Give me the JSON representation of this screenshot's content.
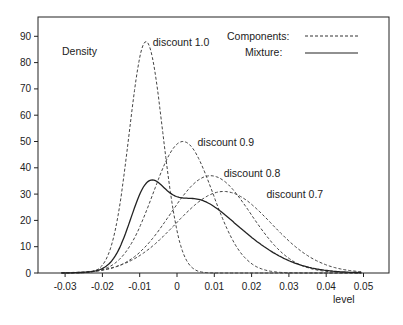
{
  "chart_data": {
    "type": "line",
    "title": "",
    "xlabel": "level",
    "ylabel": "Density",
    "xlim": [
      -0.037,
      0.057
    ],
    "ylim": [
      0,
      97
    ],
    "x_ticks": [
      "-0.03",
      "-0.02",
      "-0.01",
      "0",
      "0.01",
      "0.02",
      "0.03",
      "0.04",
      "0.05"
    ],
    "y_ticks": [
      "0",
      "10",
      "20",
      "30",
      "40",
      "50",
      "60",
      "70",
      "80",
      "90"
    ],
    "grid": false,
    "legend": {
      "position": "top-right",
      "entries": [
        {
          "label": "Components:",
          "style": "dashed"
        },
        {
          "label": "Mixture:",
          "style": "solid"
        }
      ]
    },
    "annotations": [
      {
        "text": "discount 1.0",
        "x": -0.0065,
        "y": 88
      },
      {
        "text": "discount 0.9",
        "x": 0.0055,
        "y": 50
      },
      {
        "text": "discount 0.8",
        "x": 0.0125,
        "y": 38
      },
      {
        "text": "discount 0.7",
        "x": 0.024,
        "y": 30
      }
    ],
    "series": [
      {
        "name": "discount 1.0",
        "kind": "component",
        "style": "dashed",
        "mean": -0.0083,
        "sd": 0.0045,
        "peak": 88
      },
      {
        "name": "discount 0.9",
        "kind": "component",
        "style": "dashed",
        "mean": 0.0016,
        "sd": 0.008,
        "peak": 50
      },
      {
        "name": "discount 0.8",
        "kind": "component",
        "style": "dashed",
        "mean": 0.009,
        "sd": 0.0108,
        "peak": 37
      },
      {
        "name": "discount 0.7",
        "kind": "component",
        "style": "dashed",
        "mean": 0.0125,
        "sd": 0.0128,
        "peak": 31
      },
      {
        "name": "Mixture",
        "kind": "mixture",
        "style": "solid",
        "peak": 32.5
      }
    ]
  },
  "labels": {
    "ylabel": "Density",
    "xlabel": "level",
    "legend_components": "Components:",
    "legend_mixture": "Mixture:"
  }
}
